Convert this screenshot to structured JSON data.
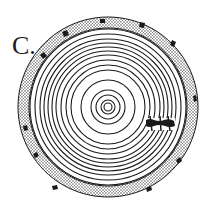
{
  "figure": {
    "label": "C.",
    "center": [
      108,
      107
    ],
    "bark": {
      "outer_radius": 90,
      "inner_radius": 79,
      "pattern": "stippled"
    },
    "rings": [
      4,
      7,
      12,
      17,
      27,
      37,
      42,
      47,
      52,
      56,
      60,
      64,
      68,
      73,
      78
    ],
    "scar": {
      "description": "dark wound mark on right side of rings",
      "x": 146,
      "y": 124
    },
    "colors": {
      "ink": "#1a1a1a",
      "paper": "#ffffff",
      "bark_fill": "#d9d9d9"
    }
  }
}
